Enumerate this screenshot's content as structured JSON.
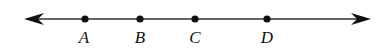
{
  "diagram": {
    "type": "number-line",
    "arrows": "both",
    "line_color": "#333333",
    "points": [
      {
        "label": "A",
        "x": 85
      },
      {
        "label": "B",
        "x": 140
      },
      {
        "label": "C",
        "x": 195
      },
      {
        "label": "D",
        "x": 267
      }
    ]
  }
}
